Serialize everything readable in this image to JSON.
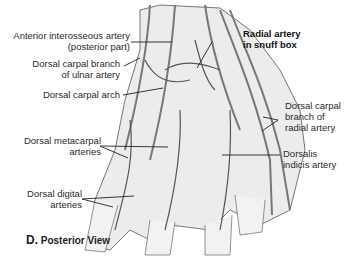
{
  "figure": {
    "labels": {
      "anterior_interosseous": [
        "Anterior interosseous artery",
        "(posterior part)"
      ],
      "dorsal_carpal_ulnar": [
        "Dorsal carpal branch",
        "of ulnar artery"
      ],
      "dorsal_carpal_arch": "Dorsal carpal arch",
      "dorsal_metacarpal": [
        "Dorsal metacarpal",
        "arteries"
      ],
      "dorsal_digital": [
        "Dorsal digital",
        "arteries"
      ],
      "radial_snuff_box": [
        "Radial artery",
        "in snuff box"
      ],
      "dorsal_carpal_radial": [
        "Dorsal carpal",
        "branch of",
        "radial artery"
      ],
      "dorsalis_indicis": [
        "Dorsalis",
        "indicis artery"
      ]
    },
    "caption": {
      "letter": "D.",
      "text": "Posterior View"
    },
    "colors": {
      "line": "#222222",
      "artery": "#6a6a6a",
      "tissue": "#d8d8d8",
      "background": "#ffffff"
    }
  }
}
